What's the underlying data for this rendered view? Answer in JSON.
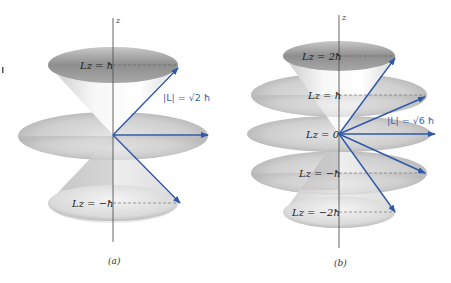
{
  "figure_a": {
    "caption": "(a)",
    "axis_label": "z",
    "magnitude_label": "|L| = √2 ħ",
    "levels": [
      {
        "label": "Lz = ħ",
        "m": 1
      },
      {
        "label": "Lz = 0",
        "m": 0,
        "shown": false
      },
      {
        "label": "Lz = −ħ",
        "m": -1
      }
    ],
    "l": 1
  },
  "figure_b": {
    "caption": "(b)",
    "axis_label": "z",
    "magnitude_label": "|L| = √6 ħ",
    "levels": [
      {
        "label": "Lz = 2ħ",
        "m": 2
      },
      {
        "label": "Lz = ħ",
        "m": 1
      },
      {
        "label": "Lz = 0",
        "m": 0
      },
      {
        "label": "Lz = −ħ",
        "m": -1
      },
      {
        "label": "Lz = −2ħ",
        "m": -2
      }
    ],
    "l": 2
  },
  "colors": {
    "vector": "#2f58a8",
    "axis": "#555555",
    "surface_dark": "#9a9a9a",
    "surface_light": "#f2f2f2"
  }
}
